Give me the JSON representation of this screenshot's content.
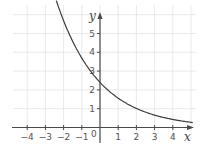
{
  "chart_data": {
    "type": "line",
    "title": "",
    "xlabel": "x",
    "ylabel": "y",
    "xlim": [
      -4.8,
      5.2
    ],
    "ylim": [
      -0.8,
      6.6
    ],
    "grid": true,
    "x_ticks": [
      -4,
      -3,
      -2,
      -1,
      1,
      2,
      3,
      4
    ],
    "x_tick_labels": [
      "−4",
      "−3",
      "−2",
      "−1",
      "1",
      "2",
      "3",
      "4"
    ],
    "y_ticks": [
      1,
      2,
      3,
      4,
      5
    ],
    "y_tick_labels": [
      "1",
      "2",
      "3",
      "4",
      "5"
    ],
    "origin_label": "0",
    "series": [
      {
        "name": "decaying exponential",
        "function": "y = 2.4 * 0.65^x",
        "x": [
          -2.4,
          -2,
          -1.5,
          -1,
          -0.5,
          0,
          0.5,
          1,
          1.5,
          2,
          2.5,
          3,
          3.5,
          4,
          4.5,
          5.1
        ],
        "y": [
          6.6,
          5.7,
          4.6,
          3.7,
          3.0,
          2.4,
          1.9,
          1.6,
          1.25,
          1.0,
          0.82,
          0.66,
          0.54,
          0.5,
          0.45,
          0.4
        ]
      }
    ],
    "colors": {
      "curve": "#3c3c3c",
      "axis": "#4a4a4a",
      "grid": "#e4e4e4"
    }
  }
}
